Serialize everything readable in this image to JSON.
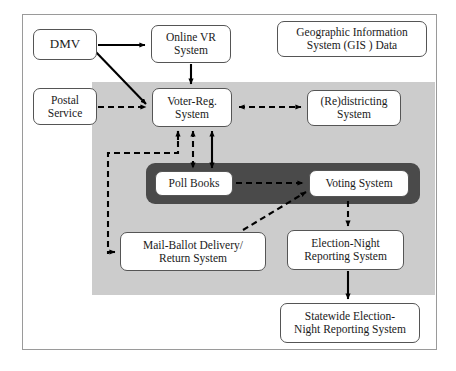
{
  "figure": {
    "title_visible": false,
    "colors": {
      "page_background": "#ffffff",
      "outer_frame_border": "#9a9a9a",
      "gray_panel": "#cccccc",
      "dark_band": "#4a4a4a",
      "node_fill": "#ffffff",
      "node_border": "#555555",
      "edge_color": "#000000"
    }
  },
  "nodes": {
    "dmv": "DMV",
    "online_vr_system": "Online VR\nSystem",
    "gis_data": "Geographic Information\nSystem (GIS ) Data",
    "postal_service": "Postal\nService",
    "voter_reg_system": "Voter-Reg.\nSystem",
    "redistricting_system": "(Re)districting\nSystem",
    "poll_books": "Poll Books",
    "voting_system": "Voting System",
    "mail_ballot_system": "Mail-Ballot Delivery/\nReturn System",
    "election_night_reporting": "Election-Night\nReporting System",
    "statewide_election_night_reporting": "Statewide Election-\nNight Reporting System"
  },
  "edges": [
    {
      "id": "dmv-to-online-vr",
      "from": "dmv",
      "to": "online_vr_system",
      "style": "solid",
      "arrows": "single"
    },
    {
      "id": "dmv-to-voter-reg",
      "from": "dmv",
      "to": "voter_reg_system",
      "style": "solid",
      "arrows": "single"
    },
    {
      "id": "online-vr-to-voter-reg",
      "from": "online_vr_system",
      "to": "voter_reg_system",
      "style": "solid",
      "arrows": "single"
    },
    {
      "id": "postal-to-voter-reg",
      "from": "postal_service",
      "to": "voter_reg_system",
      "style": "dashed",
      "arrows": "single"
    },
    {
      "id": "voter-reg-to-redistricting",
      "from": "voter_reg_system",
      "to": "redistricting_system",
      "style": "dashed",
      "arrows": "double"
    },
    {
      "id": "voter-reg-to-poll-books",
      "from": "voter_reg_system",
      "to": "poll_books",
      "style": "dashed",
      "arrows": "double"
    },
    {
      "id": "voter-reg-to-voting-system",
      "from": "voter_reg_system",
      "to": "voting_system",
      "style": "solid",
      "arrows": "double"
    },
    {
      "id": "voter-reg-to-mail-ballot",
      "from": "voter_reg_system",
      "to": "mail_ballot_system",
      "style": "dashed",
      "arrows": "single"
    },
    {
      "id": "poll-books-to-voting-system",
      "from": "poll_books",
      "to": "voting_system",
      "style": "dashed",
      "arrows": "single"
    },
    {
      "id": "mail-ballot-to-voting",
      "from": "mail_ballot_system",
      "to": "voting_system",
      "style": "dashed",
      "arrows": "single"
    },
    {
      "id": "voting-to-enrs",
      "from": "voting_system",
      "to": "election_night_reporting",
      "style": "dashed",
      "arrows": "single"
    },
    {
      "id": "enrs-to-statewide-enrs",
      "from": "election_night_reporting",
      "to": "statewide_election_night_reporting",
      "style": "solid",
      "arrows": "single"
    }
  ]
}
